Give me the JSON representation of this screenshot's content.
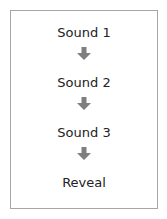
{
  "diagram": {
    "steps": [
      {
        "label": "Sound 1"
      },
      {
        "label": "Sound 2"
      },
      {
        "label": "Sound 3"
      },
      {
        "label": "Reveal"
      }
    ],
    "arrow_icon": "down-arrow-icon",
    "colors": {
      "border": "#a6a6a6",
      "arrow": "#7f7f7f",
      "text": "#222222"
    }
  }
}
